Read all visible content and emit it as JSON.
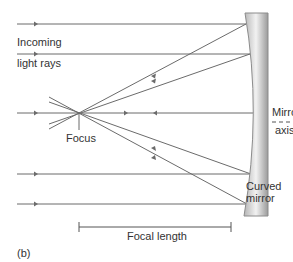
{
  "figure": {
    "panel_label": "(b)",
    "labels": {
      "incoming_line1": "Incoming",
      "incoming_line2": "light rays",
      "focus": "Focus",
      "mirror_axis_line1": "Mirror",
      "mirror_axis_line2": "axis",
      "curved_mirror_line1": "Curved",
      "curved_mirror_line2": "mirror",
      "focal_length": "Focal length"
    },
    "colors": {
      "ray": "#6b6b6b",
      "mirror_dark": "#8c8c8c",
      "mirror_light": "#f0f0f0",
      "text": "#333333"
    },
    "geometry": {
      "focus_point": [
        79,
        113
      ],
      "incoming_ray_y": [
        24,
        54,
        113,
        174,
        204
      ],
      "focal_length_span_x": [
        79,
        231
      ]
    }
  }
}
